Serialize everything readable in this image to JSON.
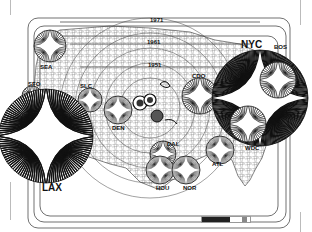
{
  "map": {
    "title": "",
    "colors": {
      "ink": "#111111",
      "paper": "#ffffff",
      "grid": "#888888"
    },
    "year_bands": [
      {
        "label": "1951"
      },
      {
        "label": "1961"
      },
      {
        "label": "1971"
      }
    ],
    "cities": [
      {
        "code": "SEA",
        "size": "small"
      },
      {
        "code": "SFO",
        "size": "small"
      },
      {
        "code": "SLC",
        "size": "small"
      },
      {
        "code": "LAX",
        "size": "large"
      },
      {
        "code": "DEN",
        "size": "small"
      },
      {
        "code": "CDO",
        "size": "small"
      },
      {
        "code": "DAL",
        "size": "small"
      },
      {
        "code": "HOU",
        "size": "small"
      },
      {
        "code": "NOR",
        "size": "small"
      },
      {
        "code": "ATL",
        "size": "small"
      },
      {
        "code": "NYC",
        "size": "large"
      },
      {
        "code": "BOS",
        "size": "small"
      },
      {
        "code": "WDC",
        "size": "small"
      }
    ],
    "scale_bar": {
      "label": ""
    }
  }
}
